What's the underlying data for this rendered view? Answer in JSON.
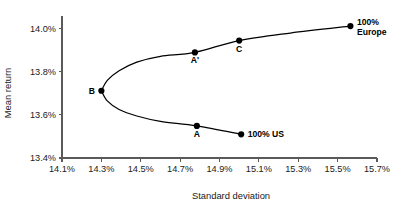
{
  "chart_data": {
    "type": "line",
    "title": "",
    "xlabel": "Standard deviation",
    "ylabel": "Mean return",
    "xlim": [
      14.1,
      15.7
    ],
    "ylim": [
      13.4,
      14.05
    ],
    "grid": false,
    "legend": "none",
    "xticks": [
      "14.1%",
      "14.3%",
      "14.5%",
      "14.7%",
      "14.9%",
      "15.1%",
      "15.3%",
      "15.5%",
      "15.7%"
    ],
    "xtick_values": [
      14.1,
      14.3,
      14.5,
      14.7,
      14.9,
      15.1,
      15.3,
      15.5,
      15.7
    ],
    "yticks": [
      "13.4%",
      "13.6%",
      "13.8%",
      "14.0%"
    ],
    "ytick_values": [
      13.4,
      13.6,
      13.8,
      14.0
    ],
    "series": [
      {
        "name": "efficient-frontier-upper",
        "comment": "upper branch of minimum-variance frontier, B to 100% Europe",
        "x": [
          14.3,
          14.33,
          14.39,
          14.48,
          14.6,
          14.775,
          15.0,
          15.26,
          15.565
        ],
        "y": [
          13.712,
          13.76,
          13.805,
          13.845,
          13.872,
          13.89,
          13.945,
          13.98,
          14.012
        ]
      },
      {
        "name": "efficient-frontier-lower",
        "comment": "lower branch of minimum-variance frontier, B to 100% US",
        "x": [
          14.3,
          14.33,
          14.39,
          14.48,
          14.6,
          14.785,
          15.01
        ],
        "y": [
          13.712,
          13.665,
          13.625,
          13.595,
          13.57,
          13.549,
          13.51
        ]
      }
    ],
    "points": [
      {
        "id": "B",
        "label": "B",
        "x": 14.3,
        "y": 13.712,
        "label_pos": "left"
      },
      {
        "id": "A-prime",
        "label": "A'",
        "x": 14.775,
        "y": 13.89,
        "label_pos": "below"
      },
      {
        "id": "C",
        "label": "C",
        "x": 15.0,
        "y": 13.945,
        "label_pos": "below"
      },
      {
        "id": "europe",
        "label": "100%\nEurope",
        "line1": "100%",
        "line2": "Europe",
        "x": 15.565,
        "y": 14.012,
        "label_pos": "right"
      },
      {
        "id": "A",
        "label": "A",
        "x": 14.785,
        "y": 13.549,
        "label_pos": "below"
      },
      {
        "id": "us",
        "label": "100% US",
        "x": 15.01,
        "y": 13.51,
        "label_pos": "right"
      }
    ],
    "annotations": [
      {
        "text": "B",
        "meaning": "minimum variance portfolio"
      },
      {
        "text": "A'",
        "meaning": "efficient portfolio with same risk as A"
      },
      {
        "text": "C",
        "meaning": "intermediate efficient portfolio"
      },
      {
        "text": "100% Europe",
        "meaning": "all-Europe portfolio"
      },
      {
        "text": "100% US",
        "meaning": "all-US portfolio"
      },
      {
        "text": "A",
        "meaning": "inefficient portfolio on lower branch"
      }
    ],
    "colors": {
      "curve": "#000000",
      "point": "#000000",
      "axis": "#5a5a5a",
      "text": "#1a1a1a",
      "background": "#ffffff"
    }
  }
}
